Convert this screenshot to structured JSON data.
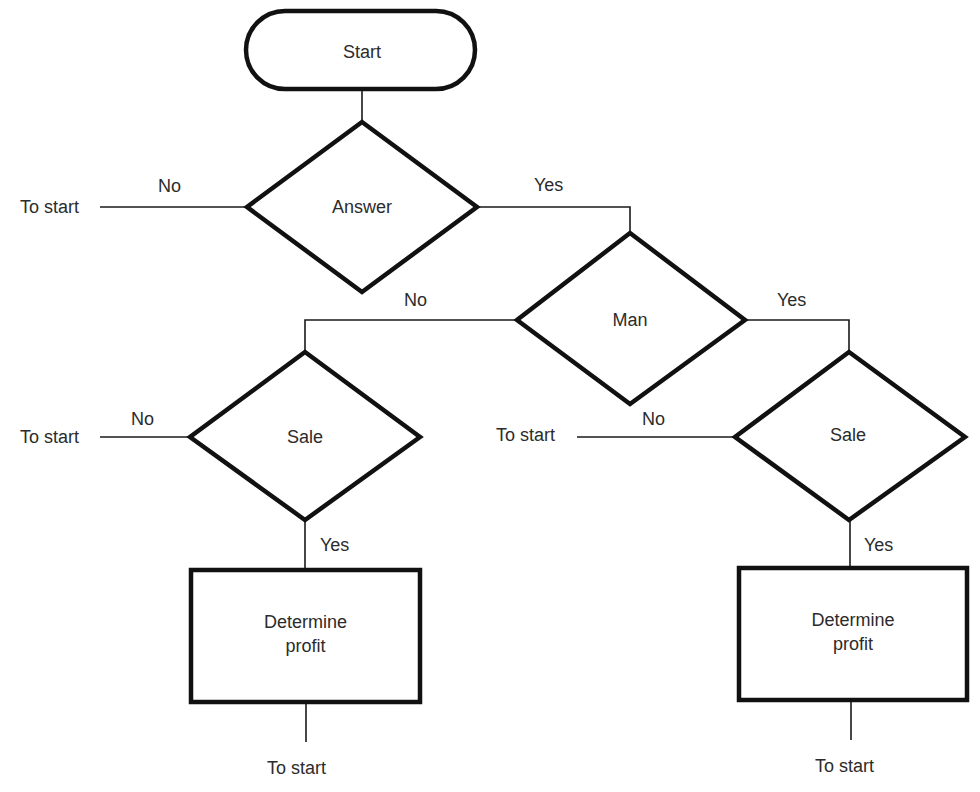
{
  "diagram": {
    "type": "flowchart",
    "nodes": {
      "start": {
        "shape": "terminator",
        "label": "Start"
      },
      "answer": {
        "shape": "decision",
        "label": "Answer"
      },
      "man": {
        "shape": "decision",
        "label": "Man"
      },
      "sale_left": {
        "shape": "decision",
        "label": "Sale"
      },
      "sale_right": {
        "shape": "decision",
        "label": "Sale"
      },
      "profit_left": {
        "shape": "process",
        "label_line1": "Determine",
        "label_line2": "profit"
      },
      "profit_right": {
        "shape": "process",
        "label_line1": "Determine",
        "label_line2": "profit"
      }
    },
    "edges": {
      "start_to_answer": {
        "from": "Start",
        "to": "Answer",
        "label": ""
      },
      "answer_no": {
        "from": "Answer",
        "to": "To start",
        "label": "No"
      },
      "answer_yes": {
        "from": "Answer",
        "to": "Man",
        "label": "Yes"
      },
      "man_no": {
        "from": "Man",
        "to": "Sale (left)",
        "label": "No"
      },
      "man_yes": {
        "from": "Man",
        "to": "Sale (right)",
        "label": "Yes"
      },
      "sale_left_no": {
        "from": "Sale (left)",
        "to": "To start",
        "label": "No"
      },
      "sale_left_yes": {
        "from": "Sale (left)",
        "to": "Determine profit (left)",
        "label": "Yes"
      },
      "sale_right_no": {
        "from": "Sale (right)",
        "to": "To start",
        "label": "No"
      },
      "sale_right_yes": {
        "from": "Sale (right)",
        "to": "Determine profit (right)",
        "label": "Yes"
      },
      "profit_left_out": {
        "from": "Determine profit (left)",
        "to": "To start",
        "label": ""
      },
      "profit_right_out": {
        "from": "Determine profit (right)",
        "to": "To start",
        "label": ""
      }
    },
    "terminals": {
      "answer_to_start": "To start",
      "sale_left_to_start": "To start",
      "sale_right_to_start": "To start",
      "profit_left_to_start": "To start",
      "profit_right_to_start": "To start"
    },
    "colors": {
      "stroke": "#111111",
      "text": "#2b2b2b",
      "background": "#ffffff"
    }
  }
}
